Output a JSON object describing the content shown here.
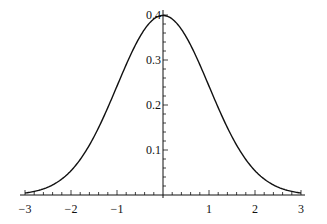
{
  "chart_data": {
    "type": "line",
    "title": "",
    "xlabel": "",
    "ylabel": "",
    "series": [
      {
        "name": "standard normal density",
        "function": "exp(-x^2/2)/sqrt(2*pi)",
        "x": [
          -3,
          -2.5,
          -2,
          -1.5,
          -1,
          -0.5,
          0,
          0.5,
          1,
          1.5,
          2,
          2.5,
          3
        ],
        "values": [
          0.0044,
          0.0175,
          0.054,
          0.1295,
          0.242,
          0.3521,
          0.3989,
          0.3521,
          0.242,
          0.1295,
          0.054,
          0.0175,
          0.0044
        ]
      }
    ],
    "xlim": [
      -3,
      3
    ],
    "ylim": [
      0,
      0.4
    ],
    "x_ticks": [
      -3,
      -2,
      -1,
      1,
      2,
      3
    ],
    "x_tick_labels": [
      "−3",
      "−2",
      "−1",
      "1",
      "2",
      "3"
    ],
    "x_minor_step": 0.2,
    "y_ticks": [
      0.1,
      0.2,
      0.3,
      0.4
    ],
    "y_tick_labels": [
      "0.1",
      "0.2",
      "0.3",
      "0.4"
    ],
    "y_minor_step": 0.02,
    "grid": false,
    "legend": "none",
    "axes_style": "crossing at origin",
    "line_color": "#111111"
  }
}
